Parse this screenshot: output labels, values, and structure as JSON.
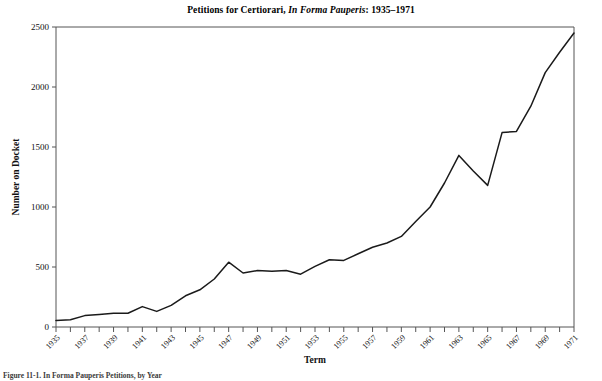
{
  "figure": {
    "title_main": "Petitions for Certiorari,",
    "title_italic": "In Forma Pauperis",
    "title_tail": ": 1935–1971",
    "caption": "Figure 11-1.  In Forma Pauperis Petitions, by Year",
    "line_color": "#1a1a1a",
    "axis_color": "#555555"
  },
  "chart_data": {
    "type": "line",
    "title": "Petitions for Certiorari, In Forma Pauperis: 1935–1971",
    "xlabel": "Term",
    "ylabel": "Number on Docket",
    "xlim": [
      1935,
      1971
    ],
    "ylim": [
      0,
      2500
    ],
    "yticks": [
      0,
      500,
      1000,
      1500,
      2000,
      2500
    ],
    "xticks": [
      1935,
      1936,
      1937,
      1938,
      1939,
      1940,
      1941,
      1942,
      1943,
      1944,
      1945,
      1946,
      1947,
      1948,
      1949,
      1950,
      1951,
      1952,
      1953,
      1954,
      1955,
      1956,
      1957,
      1958,
      1959,
      1960,
      1961,
      1962,
      1963,
      1964,
      1965,
      1966,
      1967,
      1968,
      1969,
      1970,
      1971
    ],
    "xtick_labels": [
      "1935",
      "",
      "1937",
      "",
      "1939",
      "",
      "1941",
      "",
      "1943",
      "",
      "1945",
      "",
      "1947",
      "",
      "1949",
      "",
      "1951",
      "",
      "1953",
      "",
      "1955",
      "",
      "1957",
      "",
      "1959",
      "",
      "1961",
      "",
      "1963",
      "",
      "1965",
      "",
      "1967",
      "",
      "1969",
      "",
      "1971"
    ],
    "grid": false,
    "legend": "none",
    "x": [
      1935,
      1936,
      1937,
      1938,
      1939,
      1940,
      1941,
      1942,
      1943,
      1944,
      1945,
      1946,
      1947,
      1948,
      1949,
      1950,
      1951,
      1952,
      1953,
      1954,
      1955,
      1956,
      1957,
      1958,
      1959,
      1960,
      1961,
      1962,
      1963,
      1964,
      1965,
      1966,
      1967,
      1968,
      1969,
      1970,
      1971
    ],
    "values": [
      55,
      60,
      95,
      105,
      115,
      115,
      170,
      130,
      180,
      260,
      310,
      400,
      540,
      450,
      470,
      465,
      470,
      440,
      505,
      560,
      555,
      610,
      665,
      700,
      755,
      880,
      1000,
      1200,
      1430,
      1300,
      1180,
      1620,
      1630,
      1840,
      2120,
      2290,
      2450
    ],
    "series": [
      {
        "name": "Number on Docket",
        "values": [
          55,
          60,
          95,
          105,
          115,
          115,
          170,
          130,
          180,
          260,
          310,
          400,
          540,
          450,
          470,
          465,
          470,
          440,
          505,
          560,
          555,
          610,
          665,
          700,
          755,
          880,
          1000,
          1200,
          1430,
          1300,
          1180,
          1620,
          1630,
          1840,
          2120,
          2290,
          2450
        ]
      }
    ]
  }
}
